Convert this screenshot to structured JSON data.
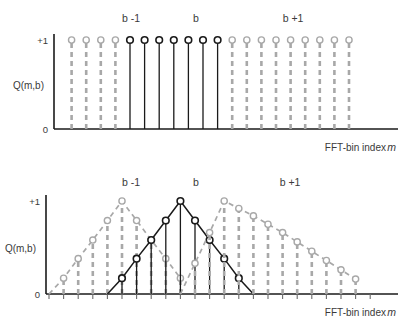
{
  "figure": {
    "background": "#ffffff",
    "color_active": "#1a1a1a",
    "color_inactive": "#a8a8a8"
  },
  "axis": {
    "y_label": "Q(m,b)",
    "y_tick_top": "+1",
    "y_tick_bottom": "0",
    "x_label": "FFT-bin index",
    "x_label_var": "m"
  },
  "group_labels": {
    "left": "b -1",
    "center": "b",
    "right": "b +1"
  },
  "chart_data": [
    {
      "type": "line",
      "title": "Q(m,b) rectangular windows",
      "xlabel": "FFT-bin index m",
      "ylabel": "Q(m,b)",
      "ylim": [
        0,
        1
      ],
      "grid": false,
      "legend": "none",
      "marker": "circle",
      "stem_style": "vertical-stems-to-zero",
      "series": [
        {
          "name": "b -1",
          "state": "inactive",
          "color": "#a8a8a8",
          "linestyle": "dashed",
          "x": [
            1,
            2,
            3,
            4
          ],
          "values": [
            1,
            1,
            1,
            1
          ]
        },
        {
          "name": "b",
          "state": "active",
          "color": "#1a1a1a",
          "linestyle": "solid",
          "x": [
            5,
            6,
            7,
            8,
            9,
            10,
            11
          ],
          "values": [
            1,
            1,
            1,
            1,
            1,
            1,
            1
          ]
        },
        {
          "name": "b +1",
          "state": "inactive",
          "color": "#a8a8a8",
          "linestyle": "dashed",
          "x": [
            12,
            13,
            14,
            15,
            16,
            17,
            18,
            19,
            20
          ],
          "values": [
            1,
            1,
            1,
            1,
            1,
            1,
            1,
            1,
            1
          ]
        }
      ]
    },
    {
      "type": "line",
      "title": "Q(m,b) triangular windows",
      "xlabel": "FFT-bin index m",
      "ylabel": "Q(m,b)",
      "ylim": [
        0,
        1
      ],
      "grid": false,
      "legend": "none",
      "marker": "circle",
      "stem_style": "vertical-stems-to-zero",
      "series": [
        {
          "name": "b -1",
          "state": "inactive",
          "color": "#a8a8a8",
          "linestyle": "dashed",
          "x": [
            0,
            1,
            2,
            3,
            4,
            5,
            6,
            7,
            8,
            9
          ],
          "values": [
            0.0,
            0.17,
            0.38,
            0.58,
            0.79,
            1.0,
            0.79,
            0.58,
            0.38,
            0.17
          ]
        },
        {
          "name": "b",
          "state": "active",
          "color": "#1a1a1a",
          "linestyle": "solid",
          "x": [
            4,
            5,
            6,
            7,
            8,
            9,
            10,
            11,
            12,
            13,
            14
          ],
          "values": [
            0.0,
            0.17,
            0.38,
            0.58,
            0.79,
            1.0,
            0.79,
            0.58,
            0.38,
            0.17,
            0.0
          ]
        },
        {
          "name": "b +1",
          "state": "inactive",
          "color": "#a8a8a8",
          "linestyle": "dashed",
          "x": [
            9,
            10,
            11,
            12,
            13,
            14,
            15,
            16,
            17,
            18,
            19,
            20,
            21
          ],
          "values": [
            0.0,
            0.33,
            0.66,
            1.0,
            0.92,
            0.84,
            0.75,
            0.66,
            0.56,
            0.46,
            0.36,
            0.26,
            0.16
          ]
        }
      ]
    }
  ]
}
